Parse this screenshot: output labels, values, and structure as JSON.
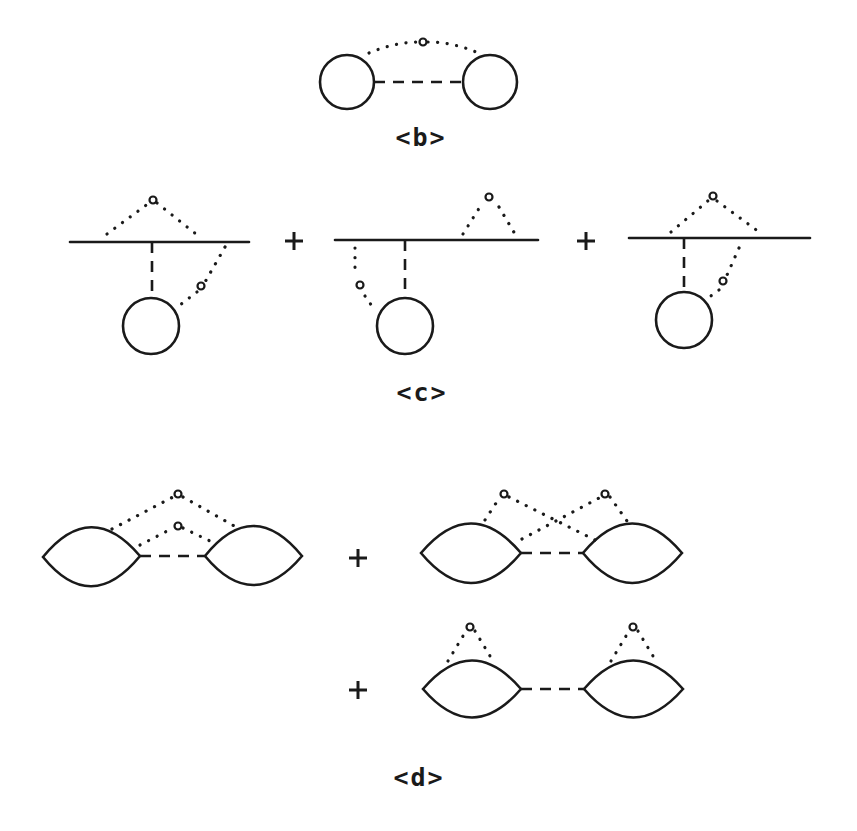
{
  "figure": {
    "background": "#ffffff",
    "ink": "#1a1a1a",
    "panels": [
      {
        "id": "b",
        "label": "<b>",
        "terms": 1,
        "description": "Two circles joined by a dashed line, with a dotted arc carrying a small open vertex connecting their tops"
      },
      {
        "id": "c",
        "label": "<c>",
        "terms": 3,
        "operators": [
          "+",
          "+"
        ],
        "description": "Horizontal solid line with dashed vertical to a circle; dotted lines with open vertices in three configurations"
      },
      {
        "id": "d",
        "label": "<d>",
        "terms": 3,
        "operators": [
          "+",
          "+"
        ],
        "description": "Pairs of lens shapes joined by a dashed line, with dotted lines carrying open vertices in three configurations"
      }
    ]
  }
}
